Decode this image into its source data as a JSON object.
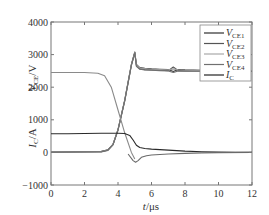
{
  "chart_data": {
    "type": "line",
    "title": "",
    "xlabel": "t/μs",
    "ylabel_top": "V_CE/V",
    "ylabel_bottom": "I_C/A",
    "xlim": [
      0,
      12
    ],
    "ylim": [
      -1000,
      4000
    ],
    "x_ticks": [
      0,
      2,
      4,
      6,
      8,
      10,
      12
    ],
    "y_ticks": [
      -1000,
      0,
      1000,
      2000,
      3000,
      4000
    ],
    "grid": false,
    "legend_position": "upper right",
    "legend": [
      "V_CE1",
      "V_CE2",
      "V_CE3",
      "V_CE4",
      "I_C"
    ],
    "series": [
      {
        "name": "V_CE1",
        "color": "#3a3a3a",
        "x": [
          0,
          3.0,
          3.4,
          3.7,
          4.0,
          4.4,
          4.8,
          5.0,
          5.1,
          5.3,
          5.6,
          6.0,
          6.5,
          7.0,
          7.3,
          7.6,
          8.0,
          9,
          10,
          11,
          12
        ],
        "y": [
          20,
          30,
          80,
          250,
          700,
          1600,
          2700,
          3080,
          2700,
          2600,
          2580,
          2560,
          2550,
          2540,
          2480,
          2540,
          2530,
          2520,
          2520,
          2510,
          2510
        ]
      },
      {
        "name": "V_CE2",
        "color": "#555555",
        "x": [
          0,
          3.0,
          3.4,
          3.7,
          4.0,
          4.4,
          4.8,
          5.0,
          5.1,
          5.3,
          5.6,
          6.0,
          6.5,
          7.0,
          7.3,
          7.6,
          8.0,
          9,
          10,
          11,
          12
        ],
        "y": [
          10,
          20,
          70,
          240,
          690,
          1580,
          2680,
          3060,
          2650,
          2560,
          2540,
          2530,
          2520,
          2510,
          2620,
          2510,
          2500,
          2500,
          2500,
          2500,
          2500
        ]
      },
      {
        "name": "V_CE3",
        "color": "#9a9a9a",
        "x": [
          0,
          3.0,
          3.4,
          3.7,
          4.0,
          4.4,
          4.8,
          5.0,
          5.1,
          5.3,
          5.6,
          6.0,
          6.5,
          7.0,
          7.3,
          7.6,
          8.0,
          9,
          10,
          11,
          12
        ],
        "y": [
          15,
          25,
          75,
          245,
          695,
          1590,
          2690,
          3070,
          2680,
          2590,
          2570,
          2550,
          2540,
          2530,
          2560,
          2530,
          2520,
          2510,
          2510,
          2510,
          2510
        ]
      },
      {
        "name": "V_CE4",
        "color": "#707070",
        "x": [
          0,
          3.0,
          3.4,
          3.7,
          4.0,
          4.4,
          4.8,
          5.0,
          5.1,
          5.3,
          5.6,
          6.0,
          6.5,
          7.0,
          7.3,
          7.6,
          8.0,
          9,
          10,
          11,
          12
        ],
        "y": [
          5,
          15,
          60,
          230,
          680,
          1570,
          2670,
          3050,
          2640,
          2550,
          2530,
          2520,
          2510,
          2500,
          2450,
          2500,
          2490,
          2490,
          2490,
          2490,
          2490
        ]
      },
      {
        "name": "V_CE_precond_high",
        "color": "#8a8a8a",
        "x": [
          0,
          2.0,
          2.8,
          3.2,
          3.6,
          4.0,
          4.4,
          4.8,
          5.0
        ],
        "y": [
          2450,
          2450,
          2430,
          2350,
          2000,
          1300,
          600,
          0,
          -200
        ]
      },
      {
        "name": "I_C",
        "color": "#2a2a2a",
        "x": [
          0,
          1,
          2,
          3,
          4,
          4.4,
          4.7,
          4.9,
          5.1,
          5.3,
          5.6,
          6.0,
          7.0,
          8.0,
          9.0,
          10,
          11,
          12
        ],
        "y": [
          570,
          575,
          580,
          585,
          585,
          580,
          520,
          380,
          220,
          150,
          120,
          100,
          70,
          40,
          20,
          10,
          5,
          0
        ]
      },
      {
        "name": "I_C_undershoot",
        "color": "#6a6a6a",
        "x": [
          4.6,
          4.9,
          5.05,
          5.2,
          5.4,
          5.7,
          6.0,
          7.0,
          8.0,
          9.0,
          10,
          12
        ],
        "y": [
          -50,
          -250,
          -300,
          -250,
          -150,
          -100,
          -80,
          -50,
          -30,
          -15,
          -5,
          0
        ]
      }
    ]
  },
  "axes": {
    "y_tick_labels": [
      "4000",
      "3000",
      "2000",
      "1000",
      "0",
      "−1000"
    ],
    "x_tick_labels": [
      "0",
      "2",
      "4",
      "6",
      "8",
      "10",
      "12"
    ],
    "ylabel_top": "V",
    "ylabel_top_sub": "CE",
    "ylabel_top_unit": "/V",
    "ylabel_bottom": "I",
    "ylabel_bottom_sub": "C",
    "ylabel_bottom_unit": "/A",
    "xlabel": "t",
    "xlabel_unit": "/μs"
  },
  "legend": {
    "items": [
      {
        "label": "V",
        "sub": "CE1",
        "color": "#2e2e2e"
      },
      {
        "label": "V",
        "sub": "CE2",
        "color": "#555555"
      },
      {
        "label": "V",
        "sub": "CE3",
        "color": "#a8a8a8"
      },
      {
        "label": "V",
        "sub": "CE4",
        "color": "#707070"
      },
      {
        "label": "I",
        "sub": "C",
        "color": "#222222"
      }
    ]
  }
}
